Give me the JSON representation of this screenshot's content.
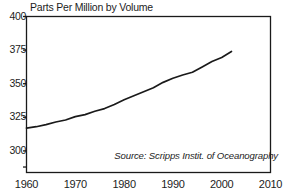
{
  "chart_data": {
    "type": "line",
    "title": "Parts Per Million by Volume",
    "xlabel": "",
    "ylabel": "",
    "source_note": "Source: Scripps Instit. of Oceanography",
    "grid": false,
    "legend": "none",
    "xlim": [
      1960,
      2010
    ],
    "ylim": [
      285,
      400
    ],
    "xticks": [
      1960,
      1970,
      1980,
      1990,
      2000,
      2010
    ],
    "xtick_labels": [
      "1960",
      "1970",
      "1980",
      "1990",
      "2000",
      "2010"
    ],
    "yticks": [
      300,
      325,
      350,
      375,
      400
    ],
    "ytick_labels": [
      "300",
      "325",
      "350",
      "375",
      "400"
    ],
    "extra_unlabeled_ytick": 288,
    "series": [
      {
        "name": "Atmospheric CO2 concentration",
        "color": "#1a1a1a",
        "x": [
          1960,
          1962,
          1964,
          1966,
          1968,
          1970,
          1972,
          1974,
          1976,
          1978,
          1980,
          1982,
          1984,
          1986,
          1988,
          1990,
          1992,
          1994,
          1996,
          1998,
          2000,
          2002
        ],
        "values": [
          317,
          318,
          319.5,
          321.5,
          323,
          325.5,
          327,
          329.5,
          331.5,
          334.5,
          338,
          341,
          344,
          347,
          351,
          354,
          356.5,
          358.5,
          362.5,
          366.5,
          369.5,
          374
        ]
      }
    ]
  },
  "axis": {
    "line_color": "#1a1a1a"
  }
}
